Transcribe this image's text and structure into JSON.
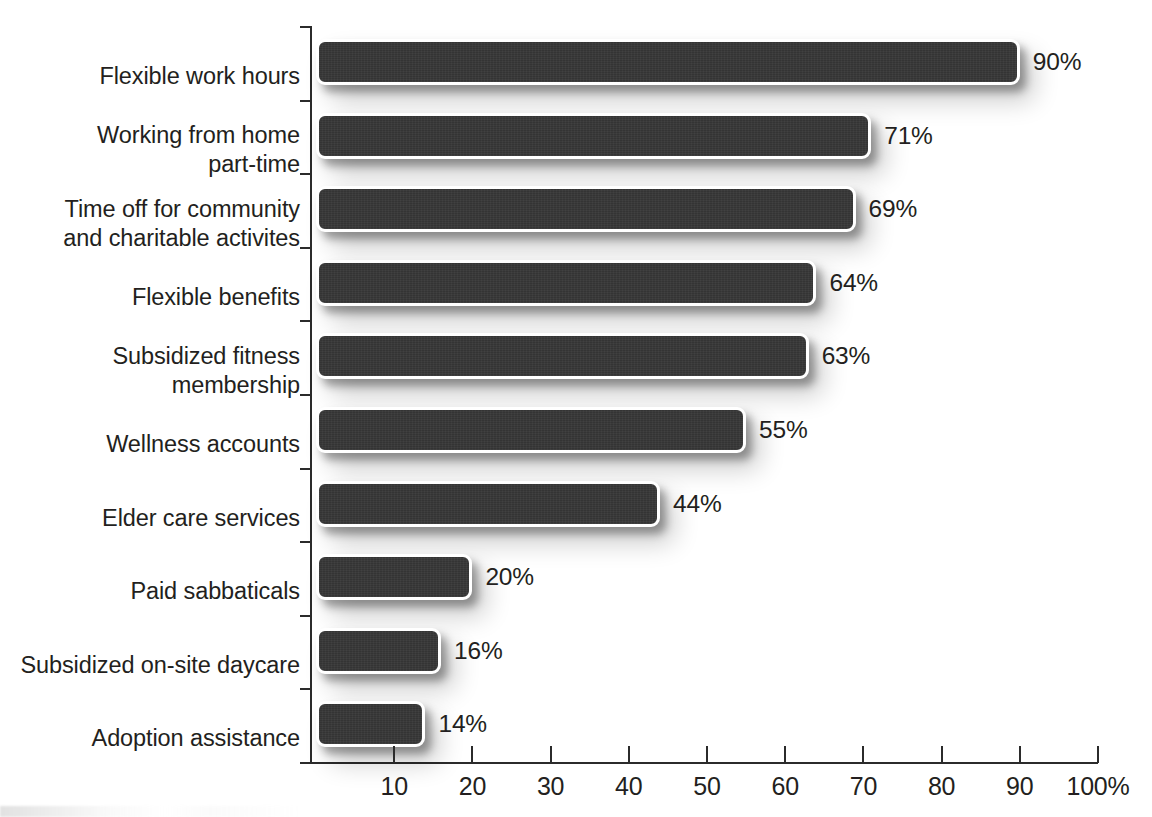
{
  "chart_data": {
    "type": "bar",
    "orientation": "horizontal",
    "title": "",
    "subtitle": "",
    "xlabel": "",
    "ylabel": "",
    "xlim": [
      0,
      100
    ],
    "grid": false,
    "legend": null,
    "value_suffix": "%",
    "categories": [
      "Flexible work hours",
      "Working from home\npart-time",
      "Time off for community\nand charitable activites",
      "Flexible benefits",
      "Subsidized fitness\nmembership",
      "Wellness accounts",
      "Elder care services",
      "Paid sabbaticals",
      "Subsidized on-site daycare",
      "Adoption assistance"
    ],
    "values": [
      90,
      71,
      69,
      64,
      63,
      55,
      44,
      20,
      16,
      14
    ],
    "value_labels": [
      "90%",
      "71%",
      "69%",
      "64%",
      "63%",
      "55%",
      "44%",
      "20%",
      "16%",
      "14%"
    ],
    "xticks": [
      10,
      20,
      30,
      40,
      50,
      60,
      70,
      80,
      90,
      100
    ],
    "xtick_labels": [
      "10",
      "20",
      "30",
      "40",
      "50",
      "60",
      "70",
      "80",
      "90",
      "100%"
    ],
    "colors": {
      "bar_fill": "#343434",
      "bar_outline": "#ffffff",
      "text": "#231f20",
      "axis": "#2b2b2b",
      "background": "#ffffff"
    }
  }
}
